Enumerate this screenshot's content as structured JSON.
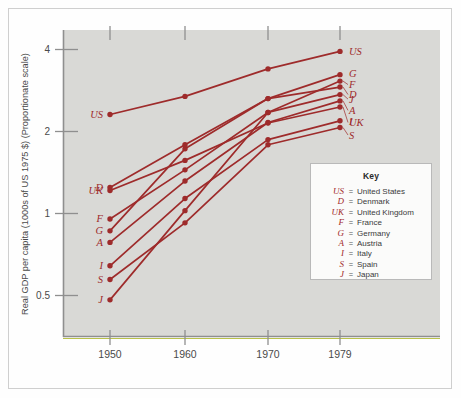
{
  "figure": {
    "background_color": "#d9d9d6",
    "series_color": "#9e2b2b",
    "frame_color": "#9a9a9a"
  },
  "axes": {
    "ylabel": "Real GDP per capita (1000s of US 1975 $) (Proportionate scale)",
    "xlabel": "",
    "yticks": [
      "4",
      "2",
      "1",
      "0.5"
    ],
    "ytick_values": [
      4,
      2,
      1,
      0.5
    ],
    "xticks": [
      "1950",
      "1960",
      "1970",
      "1979"
    ],
    "yscale": "log (proportionate scale)",
    "grid": "none"
  },
  "key": {
    "title": "Key",
    "separator": "=",
    "entries": [
      {
        "abbr": "US",
        "name": "United States"
      },
      {
        "abbr": "D",
        "name": "Denmark"
      },
      {
        "abbr": "UK",
        "name": "United Kingdom"
      },
      {
        "abbr": "F",
        "name": "France"
      },
      {
        "abbr": "G",
        "name": "Germany"
      },
      {
        "abbr": "A",
        "name": "Austria"
      },
      {
        "abbr": "I",
        "name": "Italy"
      },
      {
        "abbr": "S",
        "name": "Spain"
      },
      {
        "abbr": "J",
        "name": "Japan"
      }
    ]
  },
  "chart_data": {
    "type": "line",
    "title": "",
    "xlabel": "",
    "ylabel": "Real GDP per capita (1000s of US 1975 $) (Proportionate scale)",
    "x": [
      1950,
      1960,
      1970,
      1979
    ],
    "xtick_labels": [
      "1950",
      "1960",
      "1970",
      "1979"
    ],
    "yscale": "log",
    "ylim": [
      0.42,
      4.6
    ],
    "ytick_values": [
      4,
      2,
      1,
      0.5
    ],
    "ytick_labels": [
      "4",
      "2",
      "1",
      "0.5"
    ],
    "legend_position": "inset-lower-right",
    "marker": "filled-circle",
    "series": [
      {
        "name": "United States",
        "abbr": "US",
        "values": [
          2.3,
          2.68,
          3.38,
          3.92
        ]
      },
      {
        "name": "Germany",
        "abbr": "G",
        "values": [
          0.86,
          1.72,
          2.63,
          3.22
        ]
      },
      {
        "name": "France",
        "abbr": "F",
        "values": [
          0.95,
          1.44,
          2.34,
          3.05
        ]
      },
      {
        "name": "Denmark",
        "abbr": "D",
        "values": [
          1.24,
          1.78,
          2.63,
          2.9
        ]
      },
      {
        "name": "Japan",
        "abbr": "J",
        "values": [
          0.48,
          1.02,
          2.34,
          2.72
        ]
      },
      {
        "name": "Austria",
        "abbr": "A",
        "values": [
          0.78,
          1.31,
          2.15,
          2.58
        ]
      },
      {
        "name": "United Kingdom",
        "abbr": "UK",
        "values": [
          1.21,
          1.56,
          2.14,
          2.45
        ]
      },
      {
        "name": "Italy",
        "abbr": "I",
        "values": [
          0.64,
          1.13,
          1.86,
          2.18
        ]
      },
      {
        "name": "Spain",
        "abbr": "S",
        "values": [
          0.57,
          0.92,
          1.78,
          2.06
        ]
      }
    ],
    "left_labels": [
      "US",
      "D",
      "UK",
      "F",
      "G",
      "A",
      "I",
      "S",
      "J"
    ],
    "right_labels": [
      "US",
      "G",
      "F",
      "D",
      "J",
      "A",
      "UK",
      "I",
      "S"
    ]
  }
}
